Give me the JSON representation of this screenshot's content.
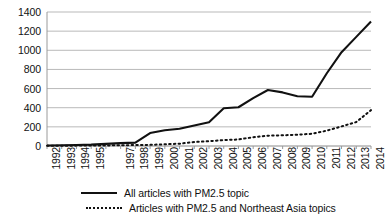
{
  "chart_data": {
    "type": "line",
    "title": "",
    "subtitle": "",
    "xlabel": "",
    "ylabel": "",
    "x": [
      1992,
      1993,
      1994,
      1995,
      1996,
      1997,
      1998,
      1999,
      2000,
      2001,
      2002,
      2003,
      2004,
      2005,
      2006,
      2007,
      2008,
      2009,
      2010,
      2011,
      2012,
      2013,
      2014
    ],
    "x_tick_labels": [
      "1992",
      "1993",
      "1994",
      "1995",
      "1997",
      "1998",
      "1999",
      "2000",
      "2001",
      "2002",
      "2003",
      "2004",
      "2005",
      "2006",
      "2007",
      "2008",
      "2009",
      "2010",
      "2011",
      "2012",
      "2013",
      "2014"
    ],
    "y_tick_labels": [
      "1400",
      "1200",
      "1000",
      "800",
      "600",
      "400",
      "200",
      "0"
    ],
    "y_ticks": [
      0,
      200,
      400,
      600,
      800,
      1000,
      1200,
      1400
    ],
    "ylim": [
      0,
      1400
    ],
    "xlim": [
      1992,
      2014
    ],
    "grid": "horizontal",
    "legend_position": "bottom",
    "series": [
      {
        "name": "All articles with PM2.5 topic",
        "style": "solid",
        "color": "#111111",
        "values": [
          5,
          8,
          10,
          14,
          22,
          30,
          35,
          135,
          165,
          180,
          215,
          248,
          395,
          405,
          500,
          585,
          560,
          520,
          515,
          760,
          980,
          1140,
          1300
        ]
      },
      {
        "name": "Articles with PM2.5 and Northeast Asia topics",
        "style": "dotted",
        "color": "#111111",
        "values": [
          2,
          3,
          4,
          5,
          6,
          8,
          10,
          12,
          18,
          24,
          42,
          50,
          62,
          68,
          92,
          108,
          112,
          118,
          128,
          160,
          205,
          250,
          375
        ]
      }
    ]
  },
  "legend": {
    "items": [
      {
        "label": "All articles with PM2.5 topic",
        "style": "solid"
      },
      {
        "label": "Articles with PM2.5 and Northeast Asia topics",
        "style": "dotted"
      }
    ]
  }
}
